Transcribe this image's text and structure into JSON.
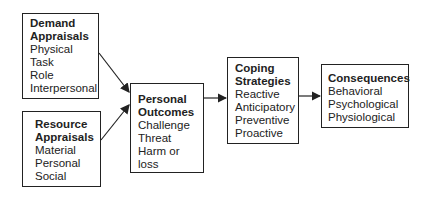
{
  "boxes": {
    "demand": {
      "title": [
        "Demand",
        "Appraisals"
      ],
      "items": [
        "Physical",
        "Task",
        "Role",
        "Interpersonal"
      ]
    },
    "resource": {
      "title": [
        "Resource",
        "Appraisals"
      ],
      "items": [
        "Material",
        "Personal",
        "Social"
      ]
    },
    "outcomes": {
      "title": [
        "Personal",
        "Outcomes"
      ],
      "items": [
        "Challenge",
        "Threat",
        "Harm or loss"
      ]
    },
    "coping": {
      "title": [
        "Coping",
        "Strategies"
      ],
      "items": [
        "Reactive",
        "Anticipatory",
        "Preventive",
        "Proactive"
      ]
    },
    "consequences": {
      "title": [
        "Consequences"
      ],
      "items": [
        "Behavioral",
        "Psychological",
        "Physiological"
      ]
    }
  },
  "colors": {
    "line": "#222222",
    "background": "#ffffff"
  }
}
